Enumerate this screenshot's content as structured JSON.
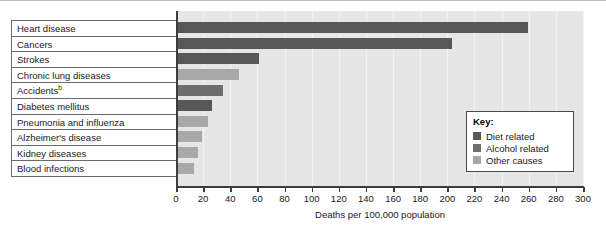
{
  "chart_data": {
    "type": "bar",
    "orientation": "horizontal",
    "title": "",
    "xlabel": "Deaths per 100,000 population",
    "ylabel": "",
    "xlim": [
      0,
      300
    ],
    "xticks": [
      0,
      20,
      40,
      60,
      80,
      100,
      120,
      140,
      160,
      180,
      200,
      220,
      240,
      260,
      280,
      300
    ],
    "grid": true,
    "legend_position": "inside-right",
    "categories": [
      "Heart disease",
      "Cancers",
      "Strokes",
      "Chronic lung diseases",
      "Accidents",
      "Diabetes mellitus",
      "Pneumonia and influenza",
      "Alzheimer's disease",
      "Kidney diseases",
      "Blood infections"
    ],
    "category_footnotes": [
      "",
      "",
      "",
      "",
      "b",
      "",
      "",
      "",
      "",
      ""
    ],
    "values": [
      258,
      202,
      60,
      45,
      33,
      25,
      22,
      18,
      15,
      12
    ],
    "groups": [
      "Diet related",
      "Diet related",
      "Diet related",
      "Other causes",
      "Alcohol related",
      "Diet related",
      "Other causes",
      "Other causes",
      "Other causes",
      "Other causes"
    ]
  },
  "legend": {
    "title": "Key:",
    "entries": [
      {
        "label": "Diet related",
        "color": "#575757"
      },
      {
        "label": "Alcohol related",
        "color": "#6e6e6e"
      },
      {
        "label": "Other causes",
        "color": "#a8a8a8"
      }
    ]
  },
  "colors": {
    "diet_related": "#575757",
    "alcohol_related": "#6e6e6e",
    "other_causes": "#a8a8a8",
    "plot_background": "#e6e6e6",
    "gridline": "#f2f2f2",
    "axis": "#3d3d3d",
    "label_border": "#6a6a6a",
    "text": "#1a1a1a"
  }
}
